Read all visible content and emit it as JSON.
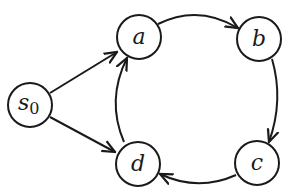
{
  "diagram": {
    "type": "state-transition-graph",
    "nodes": [
      {
        "id": "s0",
        "label": "s",
        "subscript": "0",
        "cx": 30,
        "cy": 105
      },
      {
        "id": "a",
        "label": "a",
        "cx": 139,
        "cy": 37
      },
      {
        "id": "b",
        "label": "b",
        "cx": 259,
        "cy": 39
      },
      {
        "id": "c",
        "label": "c",
        "cx": 257,
        "cy": 163
      },
      {
        "id": "d",
        "label": "d",
        "cx": 138,
        "cy": 164
      }
    ],
    "edges": [
      {
        "from": "s0",
        "to": "a"
      },
      {
        "from": "s0",
        "to": "d"
      },
      {
        "from": "a",
        "to": "b"
      },
      {
        "from": "b",
        "to": "c"
      },
      {
        "from": "c",
        "to": "d"
      },
      {
        "from": "d",
        "to": "a"
      }
    ],
    "colors": {
      "stroke": "#1a1a1a",
      "background": "#ffffff"
    }
  }
}
